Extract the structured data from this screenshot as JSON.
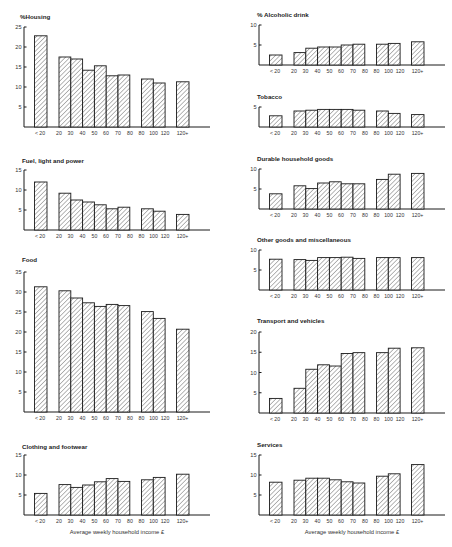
{
  "chart_data": [
    {
      "type": "bar",
      "title": "%Housing",
      "xlabel": "",
      "ylabel": "%",
      "ylim": [
        0,
        25
      ],
      "yticks": [
        5,
        10,
        15,
        20,
        25
      ],
      "categories": [
        "<20",
        "20-30",
        "30-40",
        "40-50",
        "50-60",
        "60-70",
        "70-80",
        "80-100",
        "100-120",
        "120+"
      ],
      "values": [
        22.8,
        17.5,
        17.0,
        14.2,
        15.3,
        12.8,
        13.0,
        12.0,
        11.0,
        11.3
      ]
    },
    {
      "type": "bar",
      "title": "Fuel, light and power",
      "xlabel": "",
      "ylim": [
        0,
        15
      ],
      "yticks": [
        5,
        10,
        15
      ],
      "categories": [
        "<20",
        "20-30",
        "30-40",
        "40-50",
        "50-60",
        "60-70",
        "70-80",
        "80-100",
        "100-120",
        "120+"
      ],
      "values": [
        12.0,
        9.2,
        7.5,
        7.0,
        6.3,
        5.3,
        5.7,
        5.3,
        4.7,
        3.9
      ]
    },
    {
      "type": "bar",
      "title": "Food",
      "xlabel": "",
      "ylim": [
        0,
        35
      ],
      "yticks": [
        5,
        10,
        15,
        20,
        25,
        30,
        35
      ],
      "categories": [
        "<20",
        "20-30",
        "30-40",
        "40-50",
        "50-60",
        "60-70",
        "70-80",
        "80-100",
        "100-120",
        "120+"
      ],
      "values": [
        31.3,
        30.3,
        28.5,
        27.3,
        26.4,
        26.9,
        26.6,
        25.1,
        23.4,
        20.7
      ]
    },
    {
      "type": "bar",
      "title": "Clothing and footwear",
      "xlabel": "Average weekly household income £",
      "ylim": [
        0,
        15
      ],
      "yticks": [
        5,
        10,
        15
      ],
      "categories": [
        "<20",
        "20-30",
        "30-40",
        "40-50",
        "50-60",
        "60-70",
        "70-80",
        "80-100",
        "100-120",
        "120+"
      ],
      "values": [
        5.4,
        7.6,
        6.9,
        7.5,
        8.3,
        9.1,
        8.4,
        8.8,
        9.4,
        10.2
      ]
    },
    {
      "type": "bar",
      "title": "% Alcoholic drink",
      "xlabel": "",
      "ylim": [
        0,
        10
      ],
      "yticks": [
        5,
        10
      ],
      "categories": [
        "<20",
        "20-30",
        "30-40",
        "40-50",
        "50-60",
        "60-70",
        "70-80",
        "80-100",
        "100-120",
        "120+"
      ],
      "values": [
        2.5,
        3.1,
        4.2,
        4.5,
        4.5,
        5.0,
        5.2,
        5.2,
        5.4,
        5.8
      ]
    },
    {
      "type": "bar",
      "title": "Tobacco",
      "xlabel": "",
      "ylim": [
        0,
        5
      ],
      "yticks": [
        5
      ],
      "categories": [
        "<20",
        "20-30",
        "30-40",
        "40-50",
        "50-60",
        "60-70",
        "70-80",
        "80-100",
        "100-120",
        "120+"
      ],
      "values": [
        2.8,
        4.0,
        4.2,
        4.4,
        4.4,
        4.4,
        4.2,
        4.0,
        3.4,
        3.1
      ]
    },
    {
      "type": "bar",
      "title": "Durable household goods",
      "xlabel": "",
      "ylim": [
        0,
        10
      ],
      "yticks": [
        5,
        10
      ],
      "categories": [
        "<20",
        "20-30",
        "30-40",
        "40-50",
        "50-60",
        "60-70",
        "70-80",
        "80-100",
        "100-120",
        "120+"
      ],
      "values": [
        3.8,
        5.8,
        5.1,
        6.5,
        6.8,
        6.3,
        6.3,
        7.4,
        8.7,
        8.9
      ]
    },
    {
      "type": "bar",
      "title": "Other goods and miscellaneous",
      "xlabel": "",
      "ylim": [
        0,
        10
      ],
      "yticks": [
        5,
        10
      ],
      "categories": [
        "<20",
        "20-30",
        "30-40",
        "40-50",
        "50-60",
        "60-70",
        "70-80",
        "80-100",
        "100-120",
        "120+"
      ],
      "values": [
        7.7,
        7.6,
        7.4,
        8.1,
        8.1,
        8.2,
        7.9,
        8.1,
        8.1,
        8.1
      ]
    },
    {
      "type": "bar",
      "title": "Transport and vehicles",
      "xlabel": "",
      "ylim": [
        0,
        20
      ],
      "yticks": [
        5,
        10,
        15,
        20
      ],
      "categories": [
        "<20",
        "20-30",
        "30-40",
        "40-50",
        "50-60",
        "60-70",
        "70-80",
        "80-100",
        "100-120",
        "120+"
      ],
      "values": [
        3.6,
        6.1,
        10.8,
        11.9,
        11.6,
        14.7,
        14.9,
        14.9,
        16.0,
        16.1
      ]
    },
    {
      "type": "bar",
      "title": "Services",
      "xlabel": "Average weekly household income £",
      "ylim": [
        0,
        15
      ],
      "yticks": [
        5,
        10,
        15
      ],
      "categories": [
        "<20",
        "20-30",
        "30-40",
        "40-50",
        "50-60",
        "60-70",
        "70-80",
        "80-100",
        "100-120",
        "120+"
      ],
      "values": [
        8.2,
        8.7,
        9.2,
        9.2,
        8.8,
        8.3,
        8.0,
        9.7,
        10.3,
        12.6
      ]
    }
  ],
  "x_tick_labels": [
    "< 20",
    "20",
    "30",
    "40",
    "50",
    "60",
    "70",
    "80",
    "80",
    "100",
    "120",
    "120+"
  ],
  "fill_pattern": "diagonal-hatch",
  "colors": {
    "ink": "#1a1a1a",
    "background": "#ffffff"
  }
}
